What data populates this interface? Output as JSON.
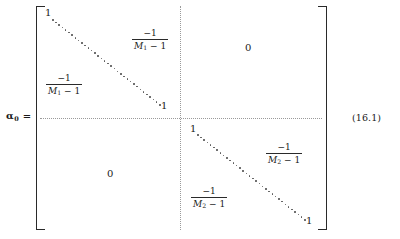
{
  "equation": {
    "label": {
      "symbol": "α",
      "subscript": "0",
      "equals": "="
    },
    "number": "(16.1)",
    "matrix": {
      "block_top_left": {
        "diagonal_start": "1",
        "diagonal_end": "1",
        "upper_entry": {
          "numerator": "−1",
          "denominator_var": "M",
          "denominator_sub": "1",
          "denominator_tail": "− 1"
        },
        "lower_entry": {
          "numerator": "−1",
          "denominator_var": "M",
          "denominator_sub": "1",
          "denominator_tail": "− 1"
        }
      },
      "block_top_right": {
        "value": "0"
      },
      "block_bottom_left": {
        "value": "0"
      },
      "block_bottom_right": {
        "diagonal_start": "1",
        "diagonal_end": "1",
        "upper_entry": {
          "numerator": "−1",
          "denominator_var": "M",
          "denominator_sub": "2",
          "denominator_tail": "− 1"
        },
        "lower_entry": {
          "numerator": "−1",
          "denominator_var": "M",
          "denominator_sub": "2",
          "denominator_tail": "− 1"
        }
      }
    }
  }
}
